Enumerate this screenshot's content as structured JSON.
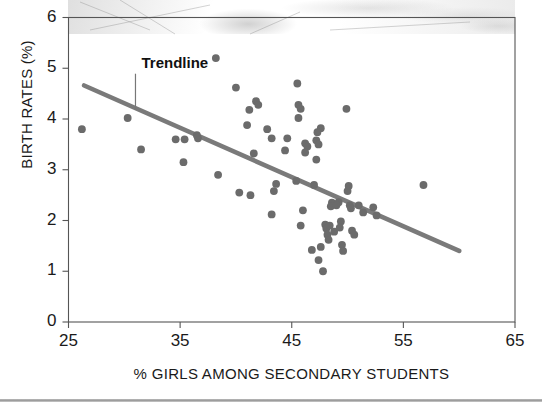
{
  "figure": {
    "background_color": "#ffffff",
    "frame_color": "#555555",
    "dot_color": "#6b6b6b",
    "trendline_color": "#7a7a7a",
    "photo_bleed_present": true
  },
  "chart_data": {
    "type": "scatter",
    "title": "",
    "xlabel": "% GIRLS AMONG SECONDARY STUDENTS",
    "ylabel": "BIRTH RATES (%)",
    "xlim": [
      25,
      65
    ],
    "ylim": [
      0,
      6
    ],
    "xticks": [
      25,
      35,
      45,
      55,
      65
    ],
    "yticks": [
      0,
      1,
      2,
      3,
      4,
      5,
      6
    ],
    "xtick_labels": [
      "25",
      "35",
      "45",
      "55",
      "65"
    ],
    "ytick_labels": [
      "0",
      "1",
      "2",
      "3",
      "4",
      "5",
      "6"
    ],
    "grid": false,
    "legend": null,
    "annotations": [
      {
        "text": "Trendline",
        "x": 31.0,
        "y": 5.05,
        "leader_to_x": 31.0,
        "leader_to_y": 4.18
      }
    ],
    "series": [
      {
        "name": "Countries",
        "type": "scatter",
        "marker": "circle",
        "color": "#6b6b6b",
        "points": [
          [
            26.2,
            3.8
          ],
          [
            30.3,
            4.02
          ],
          [
            31.5,
            3.4
          ],
          [
            34.6,
            3.6
          ],
          [
            35.4,
            3.6
          ],
          [
            35.3,
            3.15
          ],
          [
            36.5,
            3.68
          ],
          [
            36.6,
            3.62
          ],
          [
            38.2,
            5.2
          ],
          [
            38.4,
            2.9
          ],
          [
            40.0,
            4.62
          ],
          [
            40.3,
            2.55
          ],
          [
            41.3,
            2.5
          ],
          [
            41.0,
            3.88
          ],
          [
            41.2,
            4.18
          ],
          [
            41.8,
            4.35
          ],
          [
            42.0,
            4.28
          ],
          [
            41.6,
            3.32
          ],
          [
            42.8,
            3.8
          ],
          [
            43.2,
            3.62
          ],
          [
            43.6,
            2.72
          ],
          [
            43.4,
            2.58
          ],
          [
            43.2,
            2.12
          ],
          [
            44.6,
            3.62
          ],
          [
            44.4,
            3.38
          ],
          [
            45.5,
            4.7
          ],
          [
            45.6,
            4.28
          ],
          [
            45.8,
            4.2
          ],
          [
            45.6,
            4.02
          ],
          [
            45.4,
            2.78
          ],
          [
            46.2,
            3.52
          ],
          [
            46.4,
            3.46
          ],
          [
            46.2,
            3.34
          ],
          [
            46.0,
            2.2
          ],
          [
            45.8,
            1.9
          ],
          [
            47.2,
            3.58
          ],
          [
            47.4,
            3.5
          ],
          [
            47.6,
            3.82
          ],
          [
            47.3,
            3.74
          ],
          [
            47.2,
            3.2
          ],
          [
            47.0,
            2.7
          ],
          [
            46.8,
            1.42
          ],
          [
            47.4,
            1.22
          ],
          [
            47.6,
            1.48
          ],
          [
            47.8,
            1.0
          ],
          [
            48.0,
            1.92
          ],
          [
            48.1,
            1.84
          ],
          [
            48.2,
            1.72
          ],
          [
            48.3,
            1.62
          ],
          [
            48.6,
            2.35
          ],
          [
            48.5,
            2.28
          ],
          [
            48.4,
            1.9
          ],
          [
            48.8,
            1.78
          ],
          [
            49.2,
            2.36
          ],
          [
            49.0,
            2.3
          ],
          [
            49.4,
            1.98
          ],
          [
            49.3,
            1.86
          ],
          [
            49.5,
            1.52
          ],
          [
            49.6,
            1.4
          ],
          [
            50.1,
            2.68
          ],
          [
            50.0,
            2.58
          ],
          [
            50.2,
            2.3
          ],
          [
            50.3,
            2.24
          ],
          [
            50.4,
            1.8
          ],
          [
            50.6,
            1.72
          ],
          [
            51.0,
            2.3
          ],
          [
            51.4,
            2.16
          ],
          [
            52.3,
            2.26
          ],
          [
            52.6,
            2.1
          ],
          [
            56.8,
            2.7
          ],
          [
            49.9,
            4.2
          ]
        ]
      },
      {
        "name": "Trendline",
        "type": "line",
        "color": "#7a7a7a",
        "x_start": 26.4,
        "y_start": 4.66,
        "x_end": 60.0,
        "y_end": 1.4
      }
    ]
  }
}
